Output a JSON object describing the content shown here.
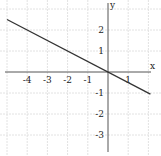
{
  "chart_data": {
    "type": "line",
    "title": "",
    "xlabel": "x",
    "ylabel": "y",
    "xlim": [
      -5.1,
      2.2
    ],
    "ylim": [
      -3.8,
      3.4
    ],
    "grid": true,
    "x_ticks": [
      -4,
      -3,
      -2,
      -1,
      1
    ],
    "y_ticks": [
      2,
      1,
      -1,
      -2,
      -3
    ],
    "x_tick_labels": [
      "-4",
      "-3",
      "-2",
      "-1",
      "1"
    ],
    "y_tick_labels": [
      "2",
      "1",
      "-1",
      "-2",
      "-3"
    ],
    "series": [
      {
        "name": "y = -0.5x",
        "x": [
          -5,
          2.1
        ],
        "y": [
          2.5,
          -1.05
        ]
      }
    ]
  },
  "colors": {
    "line": "#333333",
    "axis": "#555555",
    "grid": "#e2e2e2"
  }
}
